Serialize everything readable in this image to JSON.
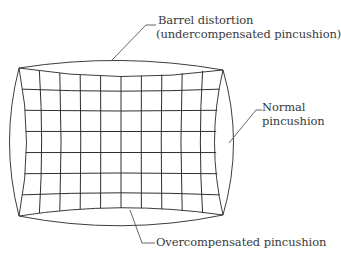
{
  "figure": {
    "labels": {
      "barrel_line1": "Barrel distortion",
      "barrel_line2": "(undercompensated pincushion)",
      "normal_line1": "Normal",
      "normal_line2": "pincushion",
      "over": "Overcompensated pincushion"
    },
    "colors": {
      "line": "#3c3c3c",
      "text": "#3a3a3a",
      "background": "#ffffff"
    },
    "corners": {
      "top_left": [
        19,
        68
      ],
      "top_right": [
        223,
        70
      ],
      "bottom_left": [
        19,
        216
      ],
      "bottom_right": [
        223,
        215
      ]
    },
    "grid": {
      "columns": 10,
      "rows": 7
    }
  }
}
